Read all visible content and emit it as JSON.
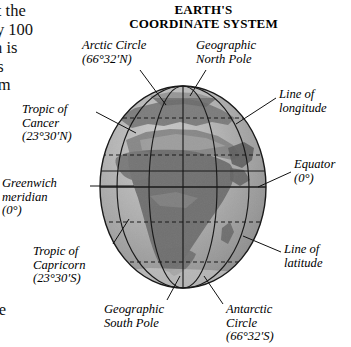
{
  "figure": {
    "title_line1": "EARTH'S",
    "title_line2": "COORDINATE SYSTEM"
  },
  "page_text": {
    "top_column_lines": [
      "bit the",
      "ely 100",
      "rth is",
      "t is",
      "rom"
    ],
    "bottom_column_lines": [
      "r",
      "the",
      "s."
    ]
  },
  "labels": {
    "arctic_circle": {
      "line1": "Arctic Circle",
      "line2": "(66°32′N)",
      "line3": ""
    },
    "north_pole": {
      "line1": "Geographic",
      "line2": "North Pole",
      "line3": ""
    },
    "line_longitude": {
      "line1": "Line of",
      "line2": "longitude",
      "line3": ""
    },
    "tropic_cancer": {
      "line1": "Tropic of",
      "line2": "Cancer",
      "line3": "(23°30′N)"
    },
    "equator": {
      "line1": "Equator",
      "line2": "(0°)",
      "line3": ""
    },
    "greenwich": {
      "line1": "Greenwich",
      "line2": "meridian",
      "line3": "(0°)"
    },
    "tropic_capricorn": {
      "line1": "Tropic of",
      "line2": "Capricorn",
      "line3": "(23°30′S)"
    },
    "line_latitude": {
      "line1": "Line of",
      "line2": "latitude",
      "line3": ""
    },
    "south_pole": {
      "line1": "Geographic",
      "line2": "South Pole",
      "line3": ""
    },
    "antarctic_circle": {
      "line1": "Antarctic",
      "line2": "Circle",
      "line3": "(66°32′S)"
    }
  },
  "colors": {
    "background": "#ffffff",
    "text": "#000000",
    "ocean": "#a8a8a8",
    "ocean_light": "#c0c0c0",
    "land": "#7b7b7b",
    "land_dark": "#5f5f5f",
    "grid_line": "#1a1a1a",
    "leader_line": "#111111",
    "globe_outline": "#1a1a1a"
  },
  "globe": {
    "center_x": 183,
    "center_y": 187,
    "radius_x": 83,
    "radius_y": 101,
    "latitude_lines": [
      "66°32′N",
      "23°30′N",
      "0°",
      "23°30′S",
      "66°32′S"
    ],
    "longitude_count": 5,
    "visible_continent": "Africa"
  }
}
